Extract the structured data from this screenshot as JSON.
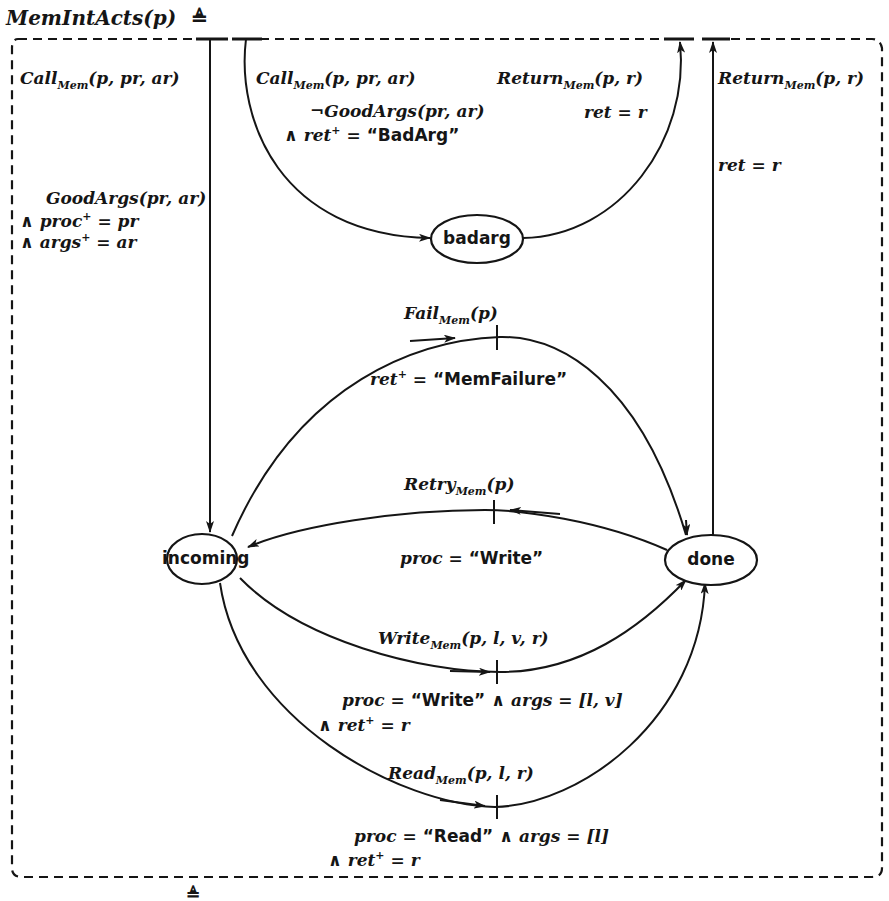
{
  "title": {
    "name": "MemIntActs(p)",
    "defsym": "≜"
  },
  "nodes": [
    {
      "id": "badarg",
      "label": "badarg"
    },
    {
      "id": "incoming",
      "label": "incoming"
    },
    {
      "id": "done",
      "label": "done"
    }
  ],
  "transitions": {
    "call_good": {
      "action": "Call",
      "sub": "Mem",
      "args": "(p, pr, ar)",
      "guard_line1": "GoodArgs(pr, ar)",
      "guard_line2_pre": "∧ proc",
      "guard_line2_sup": "+",
      "guard_line2_post": " = pr",
      "guard_line3_pre": "∧ args",
      "guard_line3_sup": "+",
      "guard_line3_post": " = ar"
    },
    "call_bad": {
      "action": "Call",
      "sub": "Mem",
      "args": "(p, pr, ar)",
      "guard_line1": "¬GoodArgs(pr, ar)",
      "guard_line2_pre": "∧ ret",
      "guard_line2_sup": "+",
      "guard_line2_eq": " = ",
      "guard_line2_val": "“BadArg”"
    },
    "return_bad": {
      "action": "Return",
      "sub": "Mem",
      "args": "(p, r)",
      "guard": "ret = r"
    },
    "return_done": {
      "action": "Return",
      "sub": "Mem",
      "args": "(p, r)",
      "guard": "ret = r"
    },
    "fail": {
      "action": "Fail",
      "sub": "Mem",
      "args": "(p)",
      "guard_pre": "ret",
      "guard_sup": "+",
      "guard_eq": " = ",
      "guard_val": "“MemFailure”"
    },
    "retry": {
      "action": "Retry",
      "sub": "Mem",
      "args": "(p)",
      "guard_pre": "proc = ",
      "guard_val": "“Write”"
    },
    "write": {
      "action": "Write",
      "sub": "Mem",
      "args": "(p, l, v, r)",
      "guard_line1_pre": "proc = ",
      "guard_line1_val": "“Write”",
      "guard_line1_post": "  ∧  args = [l, v]",
      "guard_line2_pre": "∧ ret",
      "guard_line2_sup": "+",
      "guard_line2_post": " = r"
    },
    "read": {
      "action": "Read",
      "sub": "Mem",
      "args": "(p, l, r)",
      "guard_line1_pre": "proc = ",
      "guard_line1_val": "“Read”",
      "guard_line1_post": "  ∧  args = [l]",
      "guard_line2_pre": "∧ ret",
      "guard_line2_sup": "+",
      "guard_line2_post": " = r"
    }
  },
  "footer_partial": "≜",
  "colors": {
    "ink": "#151515",
    "background": "#ffffff"
  }
}
